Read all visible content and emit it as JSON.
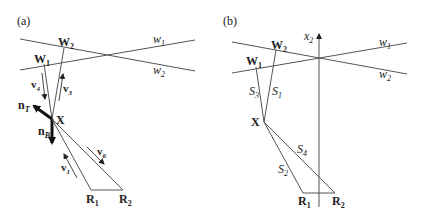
{
  "panel_a": {
    "label": "(a)",
    "lines": {
      "w1": "w",
      "w1_sub": "1",
      "w2": "w",
      "w2_sub": "2"
    },
    "points": {
      "W1": "W",
      "W1_sub": "1",
      "W2": "W",
      "W2_sub": "2",
      "X": "X",
      "R1": "R",
      "R1_sub": "1",
      "R2": "R",
      "R2_sub": "2"
    },
    "vectors": {
      "v1": "v",
      "v1_sub": "1",
      "v3": "v",
      "v3_sub": "3",
      "v4": "v",
      "v4_sub": "4",
      "v6": "v",
      "v6_sub": "6",
      "nT": "n",
      "nT_sub": "T",
      "nB": "n",
      "nB_sub": "B"
    }
  },
  "panel_b": {
    "label": "(b)",
    "axis": {
      "name": "x",
      "sub": "2"
    },
    "lines": {
      "w1": "w",
      "w1_sub": "1",
      "w2": "w",
      "w2_sub": "2"
    },
    "points": {
      "W1": "W",
      "W1_sub": "1",
      "W2": "W",
      "W2_sub": "2",
      "X": "X",
      "R1": "R",
      "R1_sub": "1",
      "R2": "R",
      "R2_sub": "2"
    },
    "segments": {
      "S1": "S",
      "S1_sub": "1",
      "S2": "S",
      "S2_sub": "2",
      "S3": "S",
      "S3_sub": "3",
      "S4": "S",
      "S4_sub": "4"
    }
  }
}
